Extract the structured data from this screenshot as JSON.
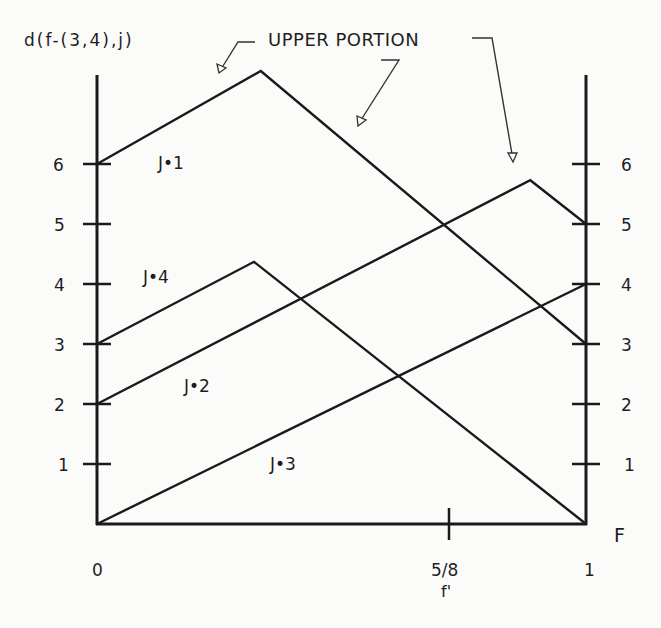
{
  "chart_data": {
    "type": "line",
    "title": "",
    "ylabel": "d(f-(3,4),j)",
    "xlabel": "F",
    "annotation": "UPPER PORTION",
    "xlim": [
      0,
      1
    ],
    "ylim": [
      0,
      7.6
    ],
    "grid": false,
    "x_ticks": [
      {
        "value": 0,
        "label": "0"
      },
      {
        "value": 0.72,
        "label": "5/8",
        "sublabel": "f'"
      },
      {
        "value": 1,
        "label": "1"
      }
    ],
    "y_ticks": [
      1,
      2,
      3,
      4,
      5,
      6
    ],
    "y_ticks_both_sides": true,
    "series": [
      {
        "name": "J=1",
        "label": "J•1",
        "points": [
          [
            0,
            6
          ],
          [
            0.335,
            7.55
          ],
          [
            1,
            3
          ]
        ]
      },
      {
        "name": "J=2",
        "label": "J•2",
        "points": [
          [
            0,
            2
          ],
          [
            0.886,
            5.73
          ],
          [
            1,
            5
          ]
        ]
      },
      {
        "name": "J=3",
        "label": "J•3",
        "points": [
          [
            0,
            0
          ],
          [
            1,
            4
          ]
        ]
      },
      {
        "name": "J=4",
        "label": "J•4",
        "points": [
          [
            0,
            3
          ],
          [
            0.321,
            4.37
          ],
          [
            1,
            0
          ]
        ]
      }
    ],
    "arrows_point_to": [
      "J=1 peak",
      "J=1 descending segment",
      "J=2 peak"
    ]
  },
  "labels": {
    "ylabel": "d(f-(3,4),j)",
    "annotation": "UPPER PORTION",
    "x_axis_name": "F",
    "x_tick_0": "0",
    "x_tick_mid": "5/8",
    "x_tick_mid_sub": "f'",
    "x_tick_1": "1",
    "y_left": [
      "1",
      "2",
      "3",
      "4",
      "5",
      "6"
    ],
    "y_right": [
      "1",
      "2",
      "3",
      "4",
      "5",
      "6"
    ],
    "j1": "J•1",
    "j2": "J•2",
    "j3": "J•3",
    "j4": "J•4"
  }
}
